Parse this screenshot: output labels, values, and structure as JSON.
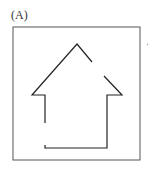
{
  "figure": {
    "label": "(A)",
    "stroke_color": "#222222",
    "frame_color": "#555555"
  }
}
